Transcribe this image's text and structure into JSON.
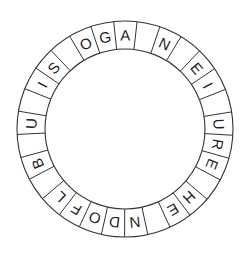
{
  "puzzle": {
    "type": "letter-ring",
    "center": [
      125,
      129
    ],
    "outer_radius": 108,
    "inner_radius": 80,
    "start_angle_deg": -6,
    "direction": "clockwise",
    "cells": [
      "A",
      "",
      "N",
      "",
      "E",
      "I",
      "",
      "U",
      "R",
      "E",
      "",
      "H",
      "E",
      "",
      "N",
      "D",
      "O",
      "F",
      "L",
      "",
      "B",
      "",
      "U",
      "",
      "I",
      "S",
      "",
      "O",
      "G"
    ]
  },
  "colors": {
    "line": "#333333",
    "text": "#222222",
    "background": "#ffffff"
  }
}
